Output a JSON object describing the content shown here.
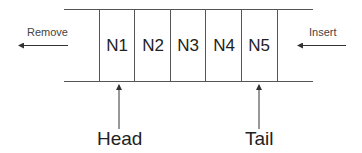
{
  "diagram": {
    "type": "queue",
    "nodes": [
      "N1",
      "N2",
      "N3",
      "N4",
      "N5"
    ],
    "labels": {
      "remove": "Remove",
      "insert": "Insert",
      "head": "Head",
      "tail": "Tail"
    },
    "colors": {
      "line": "#444444",
      "text": "#222222",
      "background": "#ffffff"
    }
  }
}
